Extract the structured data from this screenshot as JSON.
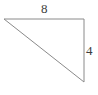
{
  "figure": {
    "kind": "right-triangle-diagram",
    "background_color": "#ffffff",
    "stroke_color": "#8a8a8a",
    "label_color": "#3c3c3c",
    "stroke_width": 1,
    "vertices": {
      "top_left": {
        "x": 4,
        "y": 19
      },
      "top_right": {
        "x": 84,
        "y": 19
      },
      "bottom_right": {
        "x": 84,
        "y": 82
      }
    },
    "labels": {
      "top_side": "8",
      "right_side": "4"
    }
  },
  "chart_data": {
    "type": "diagram",
    "title": "",
    "subtitle": "",
    "xlabel": "",
    "ylabel": "",
    "shape": "right triangle",
    "right_angle_vertex": "top-right",
    "sides": [
      {
        "name": "top",
        "label": "8",
        "value": 8,
        "from": "top_left",
        "to": "top_right",
        "orientation": "horizontal"
      },
      {
        "name": "right",
        "label": "4",
        "value": 4,
        "from": "top_right",
        "to": "bottom_right",
        "orientation": "vertical"
      },
      {
        "name": "hypotenuse",
        "label": "",
        "value": null,
        "from": "top_left",
        "to": "bottom_right",
        "orientation": "diagonal"
      }
    ],
    "annotations": [
      "8",
      "4"
    ],
    "legend": [],
    "grid": false
  }
}
